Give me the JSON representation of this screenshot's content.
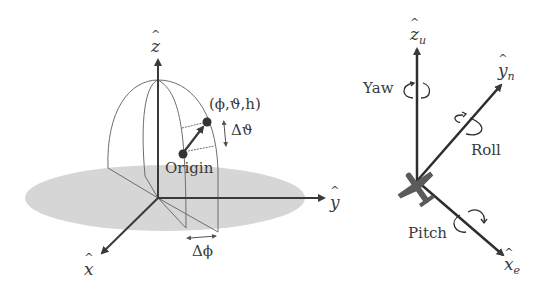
{
  "left_diagram": {
    "title": "Spherical coordinate system",
    "axes": {
      "z": "z",
      "y": "y",
      "x": "x"
    },
    "point_label": "(ϕ,ϑ,h)",
    "origin_label": "Origin",
    "delta_theta_label": "Δϑ",
    "delta_phi_label": "Δϕ"
  },
  "right_diagram": {
    "title": "Aircraft rotation axes",
    "axes": {
      "z": {
        "symbol": "z",
        "sub": "u"
      },
      "y": {
        "symbol": "y",
        "sub": "n"
      },
      "x": {
        "symbol": "x",
        "sub": "e"
      }
    },
    "rotations": {
      "yaw": "Yaw",
      "roll": "Roll",
      "pitch": "Pitch"
    }
  },
  "colors": {
    "axis": "#3a3a3a",
    "plane": "#d6d6d6",
    "wire": "#6e6e6e",
    "aircraft": "#5a5a5a"
  }
}
